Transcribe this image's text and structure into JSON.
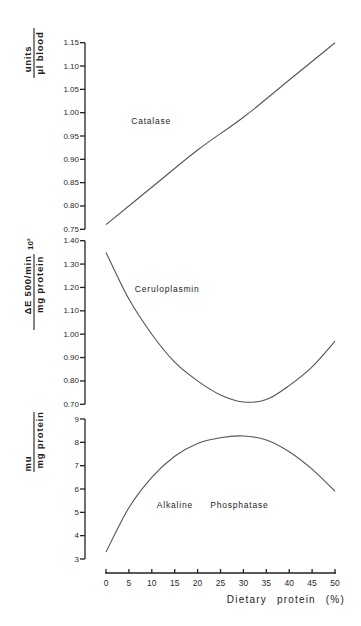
{
  "chart_data": {
    "type": "line",
    "title": "",
    "xlabel": "Dietary protein (%)",
    "xlim": [
      0,
      50
    ],
    "x_ticks": [
      "0",
      "5",
      "10",
      "15",
      "20",
      "25",
      "30",
      "35",
      "40",
      "45",
      "50"
    ],
    "grid": false,
    "legend": "none (curves labeled directly)",
    "panels": [
      {
        "name": "Catalase",
        "ylabel": {
          "numerator": "units",
          "denominator": "µl blood",
          "multiplier": ""
        },
        "ylim": [
          0.75,
          1.15
        ],
        "y_ticks": [
          "1.15",
          "1.10",
          "1.05",
          "1.00",
          "0.95",
          "0.90",
          "0.85",
          "0.80",
          "0.75"
        ],
        "series": [
          {
            "name": "Catalase",
            "x": [
              0,
              10,
              20,
              30,
              40,
              50
            ],
            "y": [
              0.76,
              0.84,
              0.92,
              0.99,
              1.07,
              1.15
            ]
          }
        ],
        "annotation": {
          "text": "Catalase",
          "x": 5.5,
          "y": 0.975
        }
      },
      {
        "name": "Ceruloplasmin",
        "ylabel": {
          "numerator": "ΔE 500/min",
          "denominator": "mg protein",
          "multiplier": "10²"
        },
        "ylim": [
          0.7,
          1.4
        ],
        "y_ticks": [
          "1.40",
          "1.30",
          "1.20",
          "1.10",
          "1.00",
          "0.90",
          "0.80",
          "0.70"
        ],
        "series": [
          {
            "name": "Ceruloplasmin",
            "x": [
              0,
              5,
              10,
              15,
              20,
              25,
              30,
              35,
              40,
              45,
              50
            ],
            "y": [
              1.35,
              1.15,
              1.0,
              0.88,
              0.8,
              0.74,
              0.71,
              0.72,
              0.78,
              0.86,
              0.97
            ]
          }
        ],
        "annotation": {
          "text": "Ceruloplasmin",
          "x": 6.3,
          "y": 1.18
        }
      },
      {
        "name": "Alkaline Phosphatase",
        "ylabel": {
          "numerator": "mu",
          "denominator": "mg protein",
          "multiplier": ""
        },
        "ylim": [
          3,
          9
        ],
        "y_ticks": [
          "9",
          "8",
          "7",
          "6",
          "5",
          "4",
          "3"
        ],
        "series": [
          {
            "name": "Alkaline Phosphatase",
            "x": [
              0,
              5,
              10,
              15,
              20,
              25,
              30,
              35,
              40,
              45,
              50
            ],
            "y": [
              3.3,
              5.2,
              6.5,
              7.4,
              7.95,
              8.2,
              8.27,
              8.1,
              7.6,
              6.85,
              5.9
            ]
          }
        ],
        "annotation": {
          "text": "Alkaline Phosphatase",
          "x": 11.1,
          "y": 5.18
        }
      }
    ]
  }
}
